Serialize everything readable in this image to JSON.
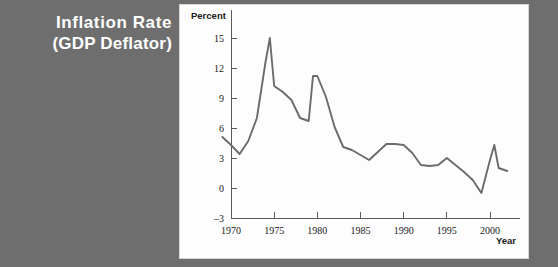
{
  "title": {
    "line1": "Inflation Rate",
    "line2": "(GDP Deflator)"
  },
  "axis_labels": {
    "y": "Percent",
    "x": "Year"
  },
  "colors": {
    "background": "#6e6e6e",
    "panel": "#fdfdfd",
    "title_text": "#ffffff",
    "line": "#6b6b6b",
    "axis": "#5a5a5a",
    "tick_text": "#1a1a1a"
  },
  "chart_data": {
    "type": "line",
    "title": "Inflation Rate (GDP Deflator)",
    "xlabel": "Year",
    "ylabel": "Percent",
    "xlim": [
      1969,
      2002.5
    ],
    "ylim": [
      -3,
      16
    ],
    "yticks": [
      -3,
      0,
      3,
      6,
      9,
      12,
      15
    ],
    "xticks": [
      1970,
      1975,
      1980,
      1985,
      1990,
      1995,
      2000
    ],
    "grid": false,
    "legend": null,
    "series": [
      {
        "name": "Inflation Rate (GDP Deflator)",
        "x": [
          1969,
          1970,
          1971,
          1972,
          1973,
          1974,
          1974.5,
          1975,
          1976,
          1977,
          1978,
          1979,
          1979.5,
          1980,
          1981,
          1982,
          1983,
          1984,
          1985,
          1986,
          1987,
          1988,
          1989,
          1990,
          1991,
          1992,
          1993,
          1994,
          1995,
          1996,
          1997,
          1998,
          1999,
          2000,
          2000.5,
          2001,
          2002
        ],
        "y": [
          5.1,
          4.3,
          3.4,
          4.7,
          7.0,
          12.6,
          15.0,
          10.2,
          9.6,
          8.8,
          7.0,
          6.7,
          11.2,
          11.2,
          9.1,
          6.1,
          4.1,
          3.8,
          3.3,
          2.8,
          3.6,
          4.4,
          4.4,
          4.3,
          3.5,
          2.3,
          2.2,
          2.3,
          3.0,
          2.3,
          1.6,
          0.8,
          -0.5,
          2.8,
          4.3,
          2.0,
          1.7
        ]
      }
    ]
  }
}
